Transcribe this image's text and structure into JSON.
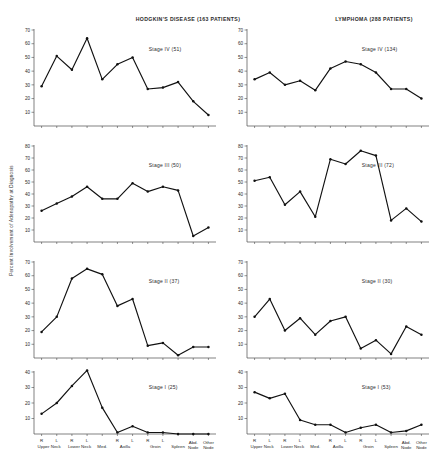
{
  "figure": {
    "ylabel": "Percent Involvement of Adenopathy at Diagnosis",
    "columns": [
      {
        "key": "hodgkins",
        "title": "HODGKIN'S DISEASE (163 PATIENTS)"
      },
      {
        "key": "lymphoma",
        "title": "LYMPHOMA  (288 PATIENTS)"
      }
    ],
    "xaxis": {
      "top_labels": [
        "R",
        "L",
        "R",
        "L",
        "",
        "R",
        "L",
        "R",
        "L",
        "",
        "",
        ""
      ],
      "bottom_labels": [
        "Upper",
        "Neck",
        "Lower",
        "Neck",
        "Med.",
        "",
        "Axilla",
        "",
        "Groin",
        "Spleen",
        "Abd.\nNode",
        "Other\nNode"
      ],
      "groups": [
        {
          "label": "Upper Neck",
          "span": [
            0,
            1
          ]
        },
        {
          "label": "Lower Neck",
          "span": [
            2,
            3
          ]
        },
        {
          "label": "Med.",
          "span": [
            4,
            4
          ]
        },
        {
          "label": "Axilla",
          "span": [
            5,
            6
          ]
        },
        {
          "label": "Groin",
          "span": [
            7,
            8
          ]
        },
        {
          "label": "Spleen",
          "span": [
            9,
            9
          ]
        },
        {
          "label": "Abd. Node",
          "span": [
            10,
            10
          ]
        },
        {
          "label": "Other Node",
          "span": [
            11,
            11
          ]
        }
      ],
      "categories": [
        "R Upper Neck",
        "L Upper Neck",
        "R Lower Neck",
        "L Lower Neck",
        "Med.",
        "R Axilla",
        "L Axilla",
        "R Groin",
        "L Groin",
        "Spleen",
        "Abd. Node",
        "Other Node"
      ]
    }
  },
  "chart_data": [
    {
      "type": "line",
      "panel": "hodgkins-stage-4",
      "title": "HODGKIN'S DISEASE (163 PATIENTS)",
      "annotation": "Stage IV  (51)",
      "stage": "Stage IV",
      "n": 51,
      "xlabel": "",
      "ylabel": "Percent Involvement of Adenopathy at Diagnosis",
      "categories": [
        "R Upper Neck",
        "L Upper Neck",
        "R Lower Neck",
        "L Lower Neck",
        "Med.",
        "R Axilla",
        "L Axilla",
        "R Groin",
        "L Groin",
        "Spleen",
        "Abd. Node",
        "Other Node"
      ],
      "values": [
        29,
        51,
        41,
        64,
        34,
        45,
        50,
        27,
        28,
        32,
        18,
        8
      ],
      "ylim": [
        0,
        70
      ],
      "yticks": [
        10,
        20,
        30,
        40,
        50,
        60,
        70
      ],
      "grid": false,
      "legend": "none"
    },
    {
      "type": "line",
      "panel": "hodgkins-stage-3",
      "title": "",
      "annotation": "Stage III  (50)",
      "stage": "Stage III",
      "n": 50,
      "xlabel": "",
      "ylabel": "",
      "categories": [
        "R Upper Neck",
        "L Upper Neck",
        "R Lower Neck",
        "L Lower Neck",
        "Med.",
        "R Axilla",
        "L Axilla",
        "R Groin",
        "L Groin",
        "Spleen",
        "Abd. Node",
        "Other Node"
      ],
      "values": [
        26,
        32,
        38,
        46,
        36,
        36,
        49,
        42,
        46,
        43,
        5,
        12
      ],
      "ylim": [
        0,
        80
      ],
      "yticks": [
        10,
        20,
        30,
        40,
        50,
        60,
        70,
        80
      ],
      "grid": false,
      "legend": "none"
    },
    {
      "type": "line",
      "panel": "hodgkins-stage-2",
      "title": "",
      "annotation": "Stage II  (37)",
      "stage": "Stage II",
      "n": 37,
      "xlabel": "",
      "ylabel": "",
      "categories": [
        "R Upper Neck",
        "L Upper Neck",
        "R Lower Neck",
        "L Lower Neck",
        "Med.",
        "R Axilla",
        "L Axilla",
        "R Groin",
        "L Groin",
        "Spleen",
        "Abd. Node",
        "Other Node"
      ],
      "values": [
        19,
        30,
        58,
        65,
        61,
        38,
        43,
        9,
        11,
        2,
        8,
        8
      ],
      "ylim": [
        0,
        70
      ],
      "yticks": [
        10,
        20,
        30,
        40,
        50,
        60,
        70
      ],
      "grid": false,
      "legend": "none"
    },
    {
      "type": "line",
      "panel": "hodgkins-stage-1",
      "title": "",
      "annotation": "Stage I  (25)",
      "stage": "Stage I",
      "n": 25,
      "xlabel": "",
      "ylabel": "",
      "categories": [
        "R Upper Neck",
        "L Upper Neck",
        "R Lower Neck",
        "L Lower Neck",
        "Med.",
        "R Axilla",
        "L Axilla",
        "R Groin",
        "L Groin",
        "Spleen",
        "Abd. Node",
        "Other Node"
      ],
      "values": [
        13,
        20,
        31,
        41,
        17,
        1,
        5,
        1,
        1,
        0,
        0,
        0
      ],
      "ylim": [
        0,
        40
      ],
      "yticks": [
        10,
        20,
        30,
        40
      ],
      "grid": false,
      "legend": "none"
    },
    {
      "type": "line",
      "panel": "lymphoma-stage-4",
      "title": "LYMPHOMA  (288 PATIENTS)",
      "annotation": "Stage IV  (134)",
      "stage": "Stage IV",
      "n": 134,
      "xlabel": "",
      "ylabel": "",
      "categories": [
        "R Upper Neck",
        "L Upper Neck",
        "R Lower Neck",
        "L Lower Neck",
        "Med.",
        "R Axilla",
        "L Axilla",
        "R Groin",
        "L Groin",
        "Spleen",
        "Abd. Node",
        "Other Node"
      ],
      "values": [
        34,
        39,
        30,
        33,
        26,
        42,
        47,
        45,
        39,
        27,
        27,
        20
      ],
      "ylim": [
        0,
        70
      ],
      "yticks": [
        10,
        20,
        30,
        40,
        50,
        60,
        70
      ],
      "grid": false,
      "legend": "none"
    },
    {
      "type": "line",
      "panel": "lymphoma-stage-3",
      "title": "",
      "annotation": "Stage III  (72)",
      "stage": "Stage III",
      "n": 72,
      "xlabel": "",
      "ylabel": "",
      "categories": [
        "R Upper Neck",
        "L Upper Neck",
        "R Lower Neck",
        "L Lower Neck",
        "Med.",
        "R Axilla",
        "L Axilla",
        "R Groin",
        "L Groin",
        "Spleen",
        "Abd. Node",
        "Other Node"
      ],
      "values": [
        51,
        54,
        31,
        42,
        21,
        69,
        65,
        76,
        72,
        18,
        28,
        17
      ],
      "ylim": [
        0,
        80
      ],
      "yticks": [
        10,
        20,
        30,
        40,
        50,
        60,
        70,
        80
      ],
      "grid": false,
      "legend": "none"
    },
    {
      "type": "line",
      "panel": "lymphoma-stage-2",
      "title": "",
      "annotation": "Stage II  (30)",
      "stage": "Stage II",
      "n": 30,
      "xlabel": "",
      "ylabel": "",
      "categories": [
        "R Upper Neck",
        "L Upper Neck",
        "R Lower Neck",
        "L Lower Neck",
        "Med.",
        "R Axilla",
        "L Axilla",
        "R Groin",
        "L Groin",
        "Spleen",
        "Abd. Node",
        "Other Node"
      ],
      "values": [
        30,
        43,
        20,
        29,
        17,
        27,
        30,
        7,
        13,
        3,
        23,
        17
      ],
      "ylim": [
        0,
        70
      ],
      "yticks": [
        10,
        20,
        30,
        40,
        50,
        60,
        70
      ],
      "grid": false,
      "legend": "none"
    },
    {
      "type": "line",
      "panel": "lymphoma-stage-1",
      "title": "",
      "annotation": "Stage I  (53)",
      "stage": "Stage I",
      "n": 53,
      "xlabel": "",
      "ylabel": "",
      "categories": [
        "R Upper Neck",
        "L Upper Neck",
        "R Lower Neck",
        "L Lower Neck",
        "Med.",
        "R Axilla",
        "L Axilla",
        "R Groin",
        "L Groin",
        "Spleen",
        "Abd. Node",
        "Other Node"
      ],
      "values": [
        27,
        23,
        26,
        9,
        6,
        6,
        1,
        4,
        6,
        1,
        2,
        6
      ],
      "ylim": [
        0,
        40
      ],
      "yticks": [
        10,
        20,
        30,
        40
      ],
      "grid": false,
      "legend": "none"
    }
  ]
}
